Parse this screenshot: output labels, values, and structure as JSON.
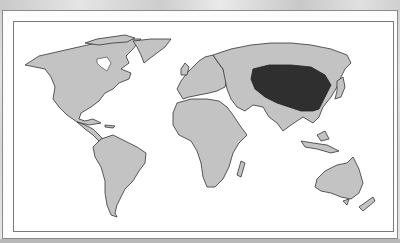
{
  "map": {
    "type": "world-map",
    "land_color": "#c3c3c3",
    "highlight_color": "#2f2f2f",
    "highlighted_region": "Central/East Asia (Mongolia and northern China)",
    "frame_border_color": "#7a7a7a"
  }
}
